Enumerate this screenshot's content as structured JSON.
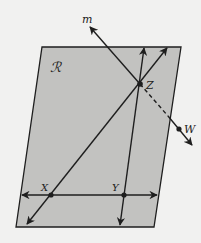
{
  "diagram": {
    "type": "geometry-plane",
    "colors": {
      "background": "#f1f1f0",
      "plane_fill": "#c2c2c0",
      "stroke": "#1e1e1e"
    },
    "plane": {
      "label": "ℛ",
      "corners": [
        [
          42,
          47
        ],
        [
          181,
          47
        ],
        [
          154,
          227
        ],
        [
          16,
          227
        ]
      ]
    },
    "points": [
      {
        "name": "X",
        "label": "X",
        "x": 51,
        "y": 195
      },
      {
        "name": "Y",
        "label": "Y",
        "x": 124,
        "y": 195
      },
      {
        "name": "Z",
        "label": "Z",
        "x": 140,
        "y": 84
      },
      {
        "name": "W",
        "label": "W",
        "x": 179,
        "y": 129
      }
    ],
    "lines": [
      {
        "name": "line-XY",
        "description": "horizontal line through X and Y",
        "from": [
          22,
          195
        ],
        "to": [
          157,
          195
        ]
      },
      {
        "name": "line-XZ",
        "description": "line through X and Z",
        "from": [
          27,
          224
        ],
        "to": [
          167,
          48
        ]
      },
      {
        "name": "line-YZ",
        "description": "line through Y (near-vertical)",
        "from": [
          120,
          225
        ],
        "to": [
          144,
          48
        ]
      },
      {
        "name": "line-m",
        "label": "m",
        "description": "line m through Z and W piercing the plane",
        "from": [
          90,
          27
        ],
        "to": [
          192,
          145
        ]
      }
    ],
    "labels": {
      "plane": "ℛ",
      "line_m": "m",
      "X": "X",
      "Y": "Y",
      "Z": "Z",
      "W": "W"
    }
  }
}
